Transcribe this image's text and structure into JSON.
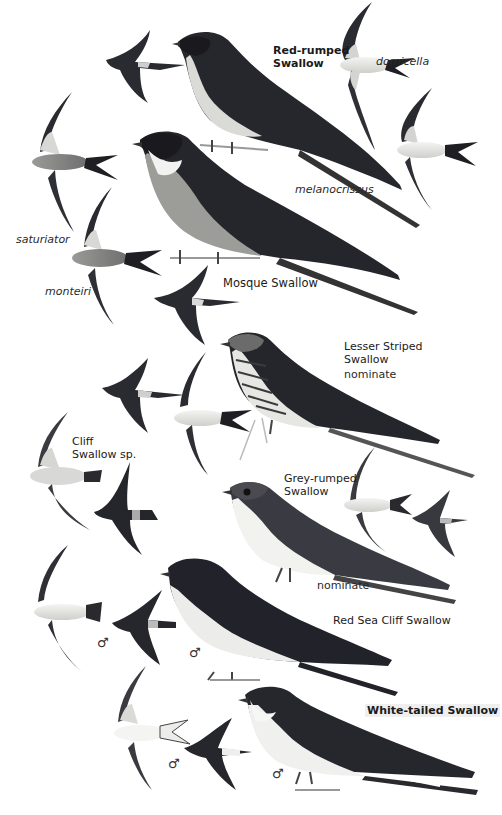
{
  "plate": {
    "background": "#ffffff",
    "ink_dark": "#1e1f24",
    "ink_mid": "#5a5a5e",
    "ink_light": "#d8d8d8",
    "species": [
      {
        "name": "Red-rumped\nSwallow",
        "subspecies": [
          "domicella",
          "melanocrissus",
          "saturiator",
          "monteiri"
        ]
      },
      {
        "name": "Mosque Swallow"
      },
      {
        "name": "Lesser Striped\nSwallow",
        "subspecies": [
          "nominate"
        ]
      },
      {
        "name": "Cliff\nSwallow sp."
      },
      {
        "name": "Grey-rumped\nSwallow",
        "subspecies": [
          "nominate"
        ]
      },
      {
        "name": "Red Sea Cliff Swallow",
        "sex_marks": [
          "♂",
          "♂"
        ]
      },
      {
        "name": "White-tailed Swallow",
        "sex_marks": [
          "♂",
          "♂"
        ]
      }
    ]
  },
  "labels": {
    "red_rumped": "Red-rumped\nSwallow",
    "domicella": "domicella",
    "melanocrissus": "melanocrissus",
    "saturiator": "saturiator",
    "monteiri": "monteiri",
    "mosque": "Mosque Swallow",
    "lesser_striped": "Lesser Striped\nSwallow",
    "lesser_striped_ssp": "nominate",
    "cliff": "Cliff\nSwallow sp.",
    "grey_rumped": "Grey-rumped\nSwallow",
    "grey_rumped_ssp": "nominate",
    "red_sea": "Red Sea Cliff Swallow",
    "white_tailed": "White-tailed Swallow",
    "male": "♂"
  }
}
